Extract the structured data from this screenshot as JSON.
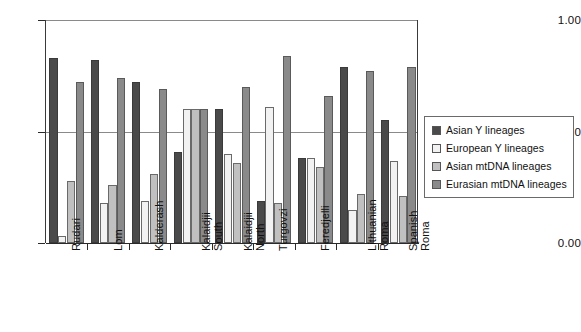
{
  "chart_data": {
    "type": "bar",
    "title": "",
    "subtitle": "",
    "xlabel": "",
    "ylabel": "",
    "ylim": [
      0.0,
      1.0
    ],
    "ytick_labels": [
      "0.00",
      "0.50",
      "1.00"
    ],
    "ytick_values": [
      0.0,
      0.5,
      1.0
    ],
    "grid": true,
    "grid_axis": "y",
    "legend_position": "right",
    "categories": [
      "Rudari",
      "Lom",
      "Kalderash",
      "Kalaidjii South",
      "Kalaidjii North",
      "Turgovzi",
      "Feredjelli",
      "Lithuanian Roma",
      "Spanish Roma"
    ],
    "series": [
      {
        "name": "Asian Y lineages",
        "color": "#4a4a4a",
        "values": [
          0.83,
          0.82,
          0.72,
          0.41,
          0.6,
          0.19,
          0.38,
          0.79,
          0.55
        ]
      },
      {
        "name": "European Y lineages",
        "color": "#f2f2f2",
        "values": [
          0.03,
          0.18,
          0.19,
          0.6,
          0.4,
          0.61,
          0.38,
          0.15,
          0.37
        ]
      },
      {
        "name": "Asian mtDNA lineages",
        "color": "#c0c0c0",
        "values": [
          0.28,
          0.26,
          0.31,
          0.6,
          0.36,
          0.18,
          0.34,
          0.22,
          0.21
        ]
      },
      {
        "name": "Eurasian mtDNA lineages",
        "color": "#8a8a8a",
        "values": [
          0.72,
          0.74,
          0.69,
          0.6,
          0.7,
          0.84,
          0.66,
          0.77,
          0.79
        ]
      }
    ]
  },
  "legend": {
    "items": [
      {
        "label": "Asian Y lineages",
        "swatch": "#4a4a4a"
      },
      {
        "label": "European Y lineages",
        "swatch": "#f2f2f2"
      },
      {
        "label": "Asian mtDNA lineages",
        "swatch": "#c0c0c0"
      },
      {
        "label": "Eurasian mtDNA lineages",
        "swatch": "#8a8a8a"
      }
    ]
  },
  "axis": {
    "y_labels": [
      "1.00",
      "0.50",
      "0.00"
    ]
  }
}
